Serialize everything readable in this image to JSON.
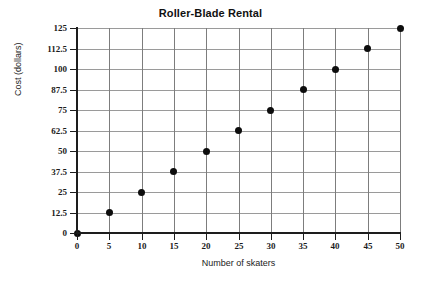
{
  "chart_data": {
    "type": "scatter",
    "title": "Roller-Blade Rental",
    "xlabel": "Number of skaters",
    "ylabel": "Cost (dollars)",
    "x": [
      0,
      5,
      10,
      15,
      20,
      25,
      30,
      35,
      40,
      45,
      50
    ],
    "values": [
      0,
      12.5,
      25,
      37.5,
      50,
      62.5,
      75,
      87.5,
      100,
      112.5,
      125
    ],
    "series": [
      {
        "name": "Cost (dollars)",
        "points": [
          {
            "x": 0,
            "y": 0
          },
          {
            "x": 5,
            "y": 12.5
          },
          {
            "x": 10,
            "y": 25
          },
          {
            "x": 15,
            "y": 37.5
          },
          {
            "x": 20,
            "y": 50
          },
          {
            "x": 25,
            "y": 62.5
          },
          {
            "x": 30,
            "y": 75
          },
          {
            "x": 35,
            "y": 87.5
          },
          {
            "x": 40,
            "y": 100
          },
          {
            "x": 45,
            "y": 112.5
          },
          {
            "x": 50,
            "y": 125
          }
        ]
      }
    ],
    "xlim": [
      0,
      50
    ],
    "ylim": [
      0,
      125
    ],
    "xticks": [
      "0",
      "5",
      "10",
      "15",
      "20",
      "25",
      "30",
      "35",
      "40",
      "45",
      "50"
    ],
    "xtick_values": [
      0,
      5,
      10,
      15,
      20,
      25,
      30,
      35,
      40,
      45,
      50
    ],
    "yticks": [
      "0",
      "12.5",
      "25",
      "37.5",
      "50",
      "62.5",
      "75",
      "87.5",
      "100",
      "112.5",
      "125"
    ],
    "ytick_values": [
      0,
      12.5,
      25,
      37.5,
      50,
      62.5,
      75,
      87.5,
      100,
      112.5,
      125
    ],
    "grid": true,
    "legend": "none",
    "marker_color": "#0d0d0d",
    "grid_color": "#9a9a9a",
    "axis_color": "#1d1d1d",
    "background_color": "#ffffff"
  }
}
